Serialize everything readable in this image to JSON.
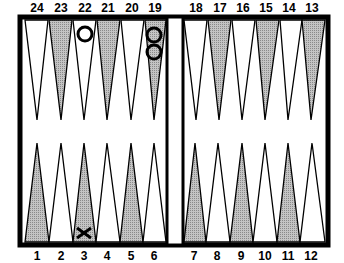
{
  "board": {
    "title": "Backgammon board",
    "shaded_color": "#a8a8a8",
    "light_color": "#ffffff",
    "frame_color": "#000000"
  },
  "top_labels": [
    "24",
    "23",
    "22",
    "21",
    "20",
    "19",
    "18",
    "17",
    "16",
    "15",
    "14",
    "13"
  ],
  "bottom_labels": [
    "1",
    "2",
    "3",
    "4",
    "5",
    "6",
    "7",
    "8",
    "9",
    "10",
    "11",
    "12"
  ],
  "checkers": [
    {
      "point": "22",
      "glyph": "O",
      "count": 1
    },
    {
      "point": "19",
      "glyph": "O",
      "count": 2
    },
    {
      "point": "3",
      "glyph": "X",
      "count": 1
    }
  ]
}
